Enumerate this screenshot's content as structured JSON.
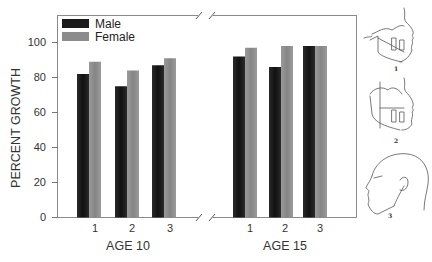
{
  "chart_data": {
    "type": "bar",
    "title": "",
    "xlabel": "",
    "ylabel": "PERCENT GROWTH",
    "ylim": [
      0,
      100
    ],
    "yticks": [
      0,
      20,
      40,
      60,
      80,
      100
    ],
    "grid": false,
    "legend_position": "top-left",
    "groups": [
      {
        "label": "AGE 10",
        "categories": [
          "1",
          "2",
          "3"
        ]
      },
      {
        "label": "AGE 15",
        "categories": [
          "1",
          "2",
          "3"
        ]
      }
    ],
    "series": [
      {
        "name": "Male",
        "color": "#1a1a1a",
        "values": {
          "AGE 10": [
            82,
            75,
            87
          ],
          "AGE 15": [
            92,
            86,
            98
          ]
        }
      },
      {
        "name": "Female",
        "color": "#8c8c8c",
        "values": {
          "AGE 10": [
            89,
            84,
            91
          ],
          "AGE 15": [
            97,
            98,
            98
          ]
        }
      }
    ],
    "axis_break": true
  },
  "legend": {
    "male": "Male",
    "female": "Female"
  },
  "axis": {
    "ylabel": "PERCENT GROWTH",
    "yticks": [
      "0",
      "20",
      "40",
      "60",
      "80",
      "100"
    ],
    "group1_label": "AGE 10",
    "group2_label": "AGE 15",
    "xticks": [
      "1",
      "2",
      "3"
    ]
  },
  "illustrations": {
    "fig1_label": "1",
    "fig2_label": "2",
    "fig3_label": "3"
  }
}
